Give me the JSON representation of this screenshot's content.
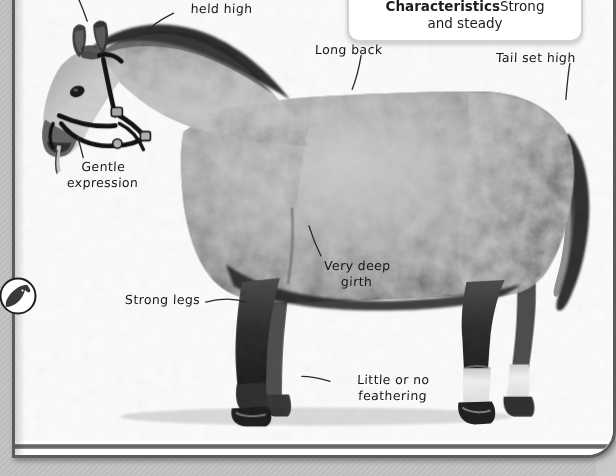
{
  "page": {
    "kind": "book-page-spread",
    "background_color": "#ffffff",
    "gutter_color": "#c4c4c4",
    "frame_color": "#5c5c5c"
  },
  "char_box": {
    "heading": "Characteristics",
    "value_line1": "Strong",
    "value_line2": "and steady",
    "border_color": "#d2d2d2"
  },
  "margin_icon": {
    "name": "horse-head-roundel",
    "color": "#3a3a3a"
  },
  "labels": [
    {
      "id": "long-ears",
      "text": "Long ears"
    },
    {
      "id": "head-and-neck",
      "text": "Head and neck\nheld high"
    },
    {
      "id": "long-back",
      "text": "Long back"
    },
    {
      "id": "tail-set-high",
      "text": "Tail set high"
    },
    {
      "id": "gentle-expression",
      "text": "Gentle\nexpression"
    },
    {
      "id": "very-deep-girth",
      "text": "Very deep\ngirth"
    },
    {
      "id": "strong-legs",
      "text": "Strong legs"
    },
    {
      "id": "little-feathering",
      "text": "Little or no\nfeathering"
    }
  ]
}
